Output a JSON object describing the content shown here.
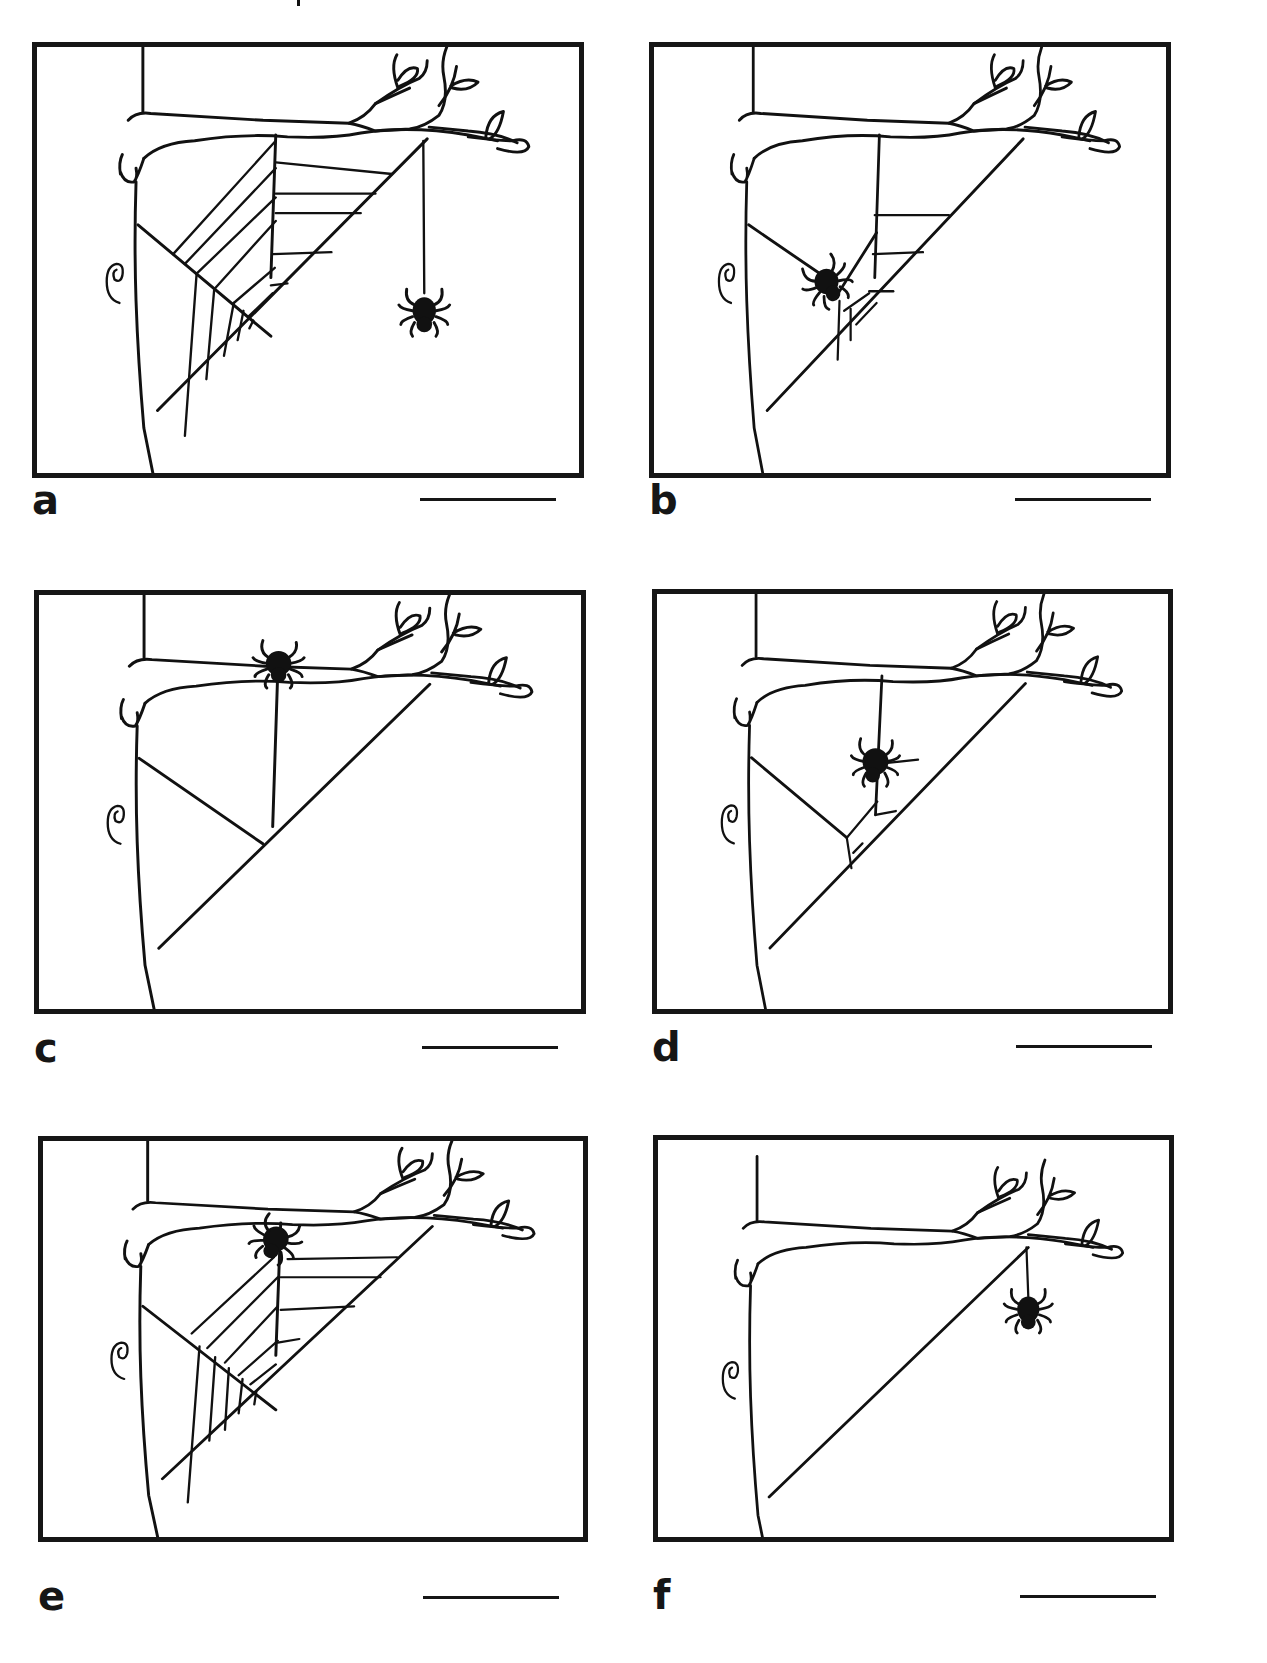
{
  "figure": {
    "panels": [
      {
        "id": "a",
        "label": "a",
        "spider_position": "hanging on dragline from branch tip",
        "web_stage": "complete web with radials and spiral threads"
      },
      {
        "id": "b",
        "label": "b",
        "spider_position": "on lower radial near hub",
        "web_stage": "partial web, few spiral threads near outer frame"
      },
      {
        "id": "c",
        "label": "c",
        "spider_position": "on branch at top of vertical radial",
        "web_stage": "frame threads only: diagonal frame line, one vertical radial, one diagonal radial"
      },
      {
        "id": "d",
        "label": "d",
        "spider_position": "on vertical radial near middle",
        "web_stage": "frame and radials with first spiral threads beginning"
      },
      {
        "id": "e",
        "label": "e",
        "spider_position": "at top of vertical radial near branch",
        "web_stage": "complete web with radials and spiral threads"
      },
      {
        "id": "f",
        "label": "f",
        "spider_position": "hanging on dragline from branch tip",
        "web_stage": "single diagonal bridge thread only"
      }
    ],
    "answer_blank": ""
  }
}
